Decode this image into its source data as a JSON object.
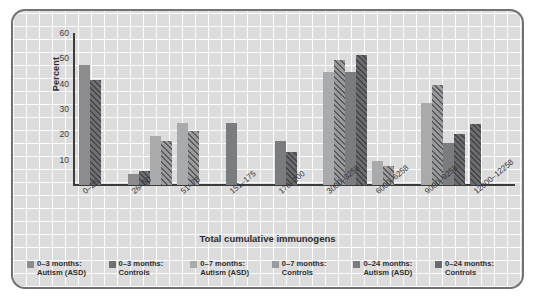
{
  "chart_data": {
    "type": "bar",
    "title": "",
    "xlabel": "Total cumulative immunogens",
    "ylabel": "Percent",
    "ylim": [
      0,
      60
    ],
    "yticks": [
      60,
      50,
      40,
      30,
      20,
      10
    ],
    "grid": true,
    "legend_position": "bottom",
    "categories": [
      "0–25",
      "26–50",
      "51–75",
      "151–175",
      "176–200",
      "3000–3258",
      "6000–6258",
      "9000–9258",
      "12000–12258"
    ],
    "series": [
      {
        "name": "0–3 months:\nAutism (ASD)",
        "swatch": "#8c8c8e",
        "pattern": "solid",
        "values": [
          47.5,
          4.5,
          null,
          null,
          null,
          null,
          null,
          null,
          null
        ]
      },
      {
        "name": "0–3 months:\nControls",
        "swatch": "#6f7073",
        "pattern": "hatch",
        "values": [
          41.5,
          5.5,
          null,
          null,
          null,
          null,
          null,
          null,
          null
        ]
      },
      {
        "name": "0–7 months:\nAutism (ASD)",
        "swatch": "#a9aaac",
        "pattern": "solid",
        "values": [
          null,
          19.5,
          24.5,
          null,
          null,
          44.5,
          9.5,
          32.5,
          null
        ]
      },
      {
        "name": "0–7 months:\nControls",
        "swatch": "#9a9b9d",
        "pattern": "hatch",
        "values": [
          null,
          17.5,
          21.5,
          null,
          null,
          49.5,
          7.5,
          39.5,
          null
        ]
      },
      {
        "name": "0–24 months:\nAutism (ASD)",
        "swatch": "#7b7c7f",
        "pattern": "solid",
        "values": [
          null,
          null,
          null,
          24.5,
          17.5,
          44.5,
          null,
          16.5,
          null
        ]
      },
      {
        "name": "0–24 months:\nControls",
        "swatch": "#6a6b6e",
        "pattern": "hatch",
        "values": [
          null,
          null,
          null,
          null,
          13.0,
          51.5,
          null,
          20.0,
          24.0
        ]
      }
    ]
  },
  "legend": {
    "items": [
      {
        "label": "0–3 months:\nAutism (ASD)"
      },
      {
        "label": "0–3 months:\nControls"
      },
      {
        "label": "0–7 months:\nAutism (ASD)"
      },
      {
        "label": "0–7 months:\nControls"
      },
      {
        "label": "0–24 months:\nAutism (ASD)"
      },
      {
        "label": "0–24 months:\nControls"
      }
    ]
  }
}
